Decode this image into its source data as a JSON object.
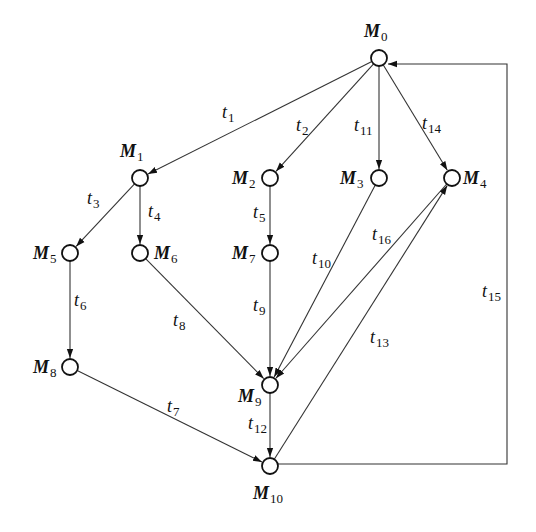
{
  "diagram": {
    "type": "reachability-graph",
    "nodes": [
      {
        "id": "M0",
        "base": "M",
        "sub": "0",
        "x": 379,
        "y": 58,
        "lx": 364,
        "ly": 37,
        "anchor": "start"
      },
      {
        "id": "M1",
        "base": "M",
        "sub": "1",
        "x": 140,
        "y": 178,
        "lx": 120,
        "ly": 157,
        "anchor": "start"
      },
      {
        "id": "M2",
        "base": "M",
        "sub": "2",
        "x": 270,
        "y": 178,
        "lx": 232,
        "ly": 184,
        "anchor": "start"
      },
      {
        "id": "M3",
        "base": "M",
        "sub": "3",
        "x": 379,
        "y": 178,
        "lx": 340,
        "ly": 184,
        "anchor": "start"
      },
      {
        "id": "M4",
        "base": "M",
        "sub": "4",
        "x": 452,
        "y": 178,
        "lx": 463,
        "ly": 184,
        "anchor": "start"
      },
      {
        "id": "M5",
        "base": "M",
        "sub": "5",
        "x": 70,
        "y": 253,
        "lx": 33,
        "ly": 259,
        "anchor": "start"
      },
      {
        "id": "M6",
        "base": "M",
        "sub": "6",
        "x": 140,
        "y": 253,
        "lx": 154,
        "ly": 259,
        "anchor": "start"
      },
      {
        "id": "M7",
        "base": "M",
        "sub": "7",
        "x": 270,
        "y": 253,
        "lx": 232,
        "ly": 259,
        "anchor": "start"
      },
      {
        "id": "M8",
        "base": "M",
        "sub": "8",
        "x": 70,
        "y": 367,
        "lx": 33,
        "ly": 373,
        "anchor": "start"
      },
      {
        "id": "M9",
        "base": "M",
        "sub": "9",
        "x": 270,
        "y": 385,
        "lx": 238,
        "ly": 402,
        "anchor": "start"
      },
      {
        "id": "M10",
        "base": "M",
        "sub": "10",
        "x": 270,
        "y": 466,
        "lx": 253,
        "ly": 499,
        "anchor": "start"
      }
    ],
    "edges": [
      {
        "id": "t1",
        "from": "M0",
        "to": "M1",
        "base": "t",
        "sub": "1",
        "lx": 222,
        "ly": 118
      },
      {
        "id": "t2",
        "from": "M0",
        "to": "M2",
        "base": "t",
        "sub": "2",
        "lx": 296,
        "ly": 131
      },
      {
        "id": "t11",
        "from": "M0",
        "to": "M3",
        "base": "t",
        "sub": "11",
        "lx": 354,
        "ly": 131
      },
      {
        "id": "t14",
        "from": "M0",
        "to": "M4",
        "base": "t",
        "sub": "14",
        "lx": 422,
        "ly": 129
      },
      {
        "id": "t3",
        "from": "M1",
        "to": "M5",
        "base": "t",
        "sub": "3",
        "lx": 87,
        "ly": 204
      },
      {
        "id": "t4",
        "from": "M1",
        "to": "M6",
        "base": "t",
        "sub": "4",
        "lx": 148,
        "ly": 217
      },
      {
        "id": "t5",
        "from": "M2",
        "to": "M7",
        "base": "t",
        "sub": "5",
        "lx": 253,
        "ly": 218
      },
      {
        "id": "t6",
        "from": "M5",
        "to": "M8",
        "base": "t",
        "sub": "6",
        "lx": 74,
        "ly": 306
      },
      {
        "id": "t8",
        "from": "M6",
        "to": "M9",
        "base": "t",
        "sub": "8",
        "lx": 173,
        "ly": 326
      },
      {
        "id": "t9",
        "from": "M7",
        "to": "M9",
        "base": "t",
        "sub": "9",
        "lx": 253,
        "ly": 311
      },
      {
        "id": "t10",
        "from": "M3",
        "to": "M9",
        "base": "t",
        "sub": "10",
        "lx": 312,
        "ly": 264
      },
      {
        "id": "t16",
        "from": "M4",
        "to": "M9",
        "base": "t",
        "sub": "16",
        "lx": 372,
        "ly": 240
      },
      {
        "id": "t7",
        "from": "M8",
        "to": "M10",
        "base": "t",
        "sub": "7",
        "lx": 167,
        "ly": 412
      },
      {
        "id": "t12",
        "from": "M9",
        "to": "M10",
        "base": "t",
        "sub": "12",
        "lx": 248,
        "ly": 429
      },
      {
        "id": "t13",
        "from": "M10",
        "to": "M4",
        "base": "t",
        "sub": "13",
        "lx": 370,
        "ly": 343
      },
      {
        "id": "t15",
        "from": "M10",
        "to": "M0",
        "base": "t",
        "sub": "15",
        "lx": 482,
        "ly": 297,
        "route": "right-loop",
        "loop_x": 507
      }
    ]
  }
}
